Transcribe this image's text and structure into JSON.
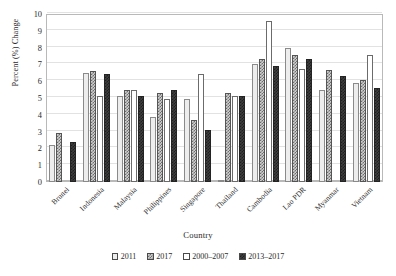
{
  "chart_data": {
    "type": "bar",
    "title": "",
    "subtitle": "",
    "xlabel": "Country",
    "ylabel": "Percent (%) Change",
    "ylim": [
      0,
      10
    ],
    "yticks": [
      0,
      1,
      2,
      3,
      4,
      5,
      6,
      7,
      8,
      9,
      10
    ],
    "grid": true,
    "legend_position": "bottom",
    "categories": [
      "Brunei",
      "Indonesia",
      "Malaysia",
      "Philippines",
      "Singapore",
      "Thailand",
      "Cambodia",
      "Lao PDR",
      "Myanmar",
      "Vietnam"
    ],
    "series": [
      {
        "name": "2011",
        "pattern": "light-dotted",
        "values": [
          2.2,
          6.5,
          5.1,
          3.85,
          4.95,
          0.1,
          7.05,
          8.0,
          5.5,
          5.9
        ]
      },
      {
        "name": "2017",
        "pattern": "medium-checker",
        "values": [
          2.9,
          6.6,
          5.5,
          5.3,
          3.7,
          5.3,
          7.3,
          7.55,
          6.65,
          6.1
        ]
      },
      {
        "name": "2000–2007",
        "pattern": "open-white",
        "values": [
          null,
          5.1,
          5.5,
          4.95,
          6.4,
          5.1,
          9.6,
          6.75,
          null,
          7.55
        ]
      },
      {
        "name": "2013–2017",
        "pattern": "dark-checker",
        "values": [
          2.4,
          6.4,
          5.1,
          5.5,
          3.1,
          5.1,
          6.9,
          7.35,
          6.3,
          5.6
        ]
      }
    ]
  },
  "legend": {
    "items": [
      {
        "label": "2011"
      },
      {
        "label": "2017"
      },
      {
        "label": "2000–2007"
      },
      {
        "label": "2013–2017"
      }
    ]
  }
}
